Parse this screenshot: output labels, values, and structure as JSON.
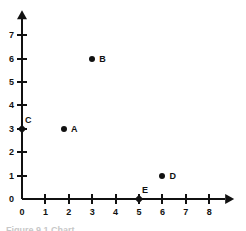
{
  "chart_data": {
    "type": "scatter",
    "title": "",
    "xlabel": "",
    "ylabel": "",
    "xlim": [
      0,
      8
    ],
    "ylim": [
      0,
      7
    ],
    "x_ticks": [
      0,
      1,
      2,
      3,
      4,
      5,
      6,
      7,
      8
    ],
    "y_ticks": [
      0,
      1,
      2,
      3,
      4,
      5,
      6,
      7
    ],
    "x_tick_labels": [
      "0",
      "1",
      "2",
      "3",
      "4",
      "5",
      "6",
      "7",
      "8"
    ],
    "y_tick_labels": [
      "0",
      "1",
      "2",
      "3",
      "4",
      "5",
      "6",
      "7"
    ],
    "grid": false,
    "legend": false,
    "legend_position": "none",
    "axis_color": "#111111",
    "point_color": "#111111",
    "background_color": "#ffffff",
    "x_axis_has_arrow": true,
    "y_axis_has_arrow": true,
    "points": [
      {
        "label": "A",
        "x": 1.8,
        "y": 3,
        "marker": "dot",
        "label_position": "right"
      },
      {
        "label": "B",
        "x": 3,
        "y": 6,
        "marker": "dot",
        "label_position": "right"
      },
      {
        "label": "C",
        "x": 0,
        "y": 3,
        "marker": "diamond",
        "label_position": "above-right"
      },
      {
        "label": "D",
        "x": 6,
        "y": 1,
        "marker": "dot",
        "label_position": "right"
      },
      {
        "label": "E",
        "x": 5,
        "y": 0,
        "marker": "diamond",
        "label_position": "above-right"
      }
    ]
  },
  "caption": {
    "text": "Figure 9.1   Chart"
  }
}
